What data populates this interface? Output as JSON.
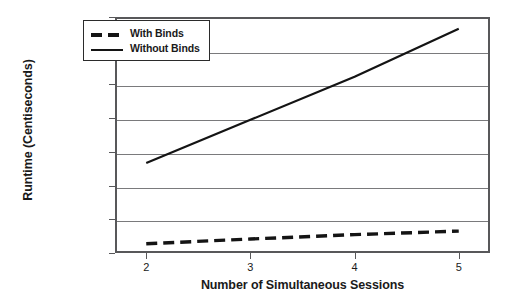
{
  "chart_data": {
    "type": "line",
    "title": "",
    "xlabel": "Number of Simultaneous Sessions",
    "ylabel": "Runtime (Centiseconds)",
    "x": [
      2,
      3,
      4,
      5
    ],
    "xtick_labels": [
      "2",
      "3",
      "4",
      "5"
    ],
    "ytick_labels": [
      "0",
      "2000",
      "4000",
      "6000",
      "8000",
      "10000",
      "12000",
      "14000"
    ],
    "ytick_values": [
      0,
      2000,
      4000,
      6000,
      8000,
      10000,
      12000,
      14000
    ],
    "ylim": [
      0,
      14000
    ],
    "xlim": [
      1.7,
      5.3
    ],
    "grid": "horizontal",
    "legend_position": "top-left-inside",
    "series": [
      {
        "name": "With Binds",
        "style": "dashed",
        "color": "#141414",
        "values": [
          550,
          830,
          1090,
          1300
        ]
      },
      {
        "name": "Without Binds",
        "style": "solid",
        "color": "#141414",
        "values": [
          5340,
          7900,
          10450,
          13300
        ]
      }
    ]
  },
  "legend": {
    "items": [
      {
        "label": "With Binds",
        "style": "dashed"
      },
      {
        "label": "Without Binds",
        "style": "solid"
      }
    ]
  }
}
